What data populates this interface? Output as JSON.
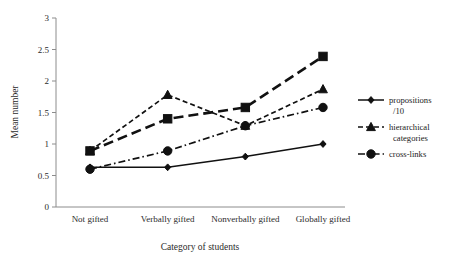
{
  "chart_data": {
    "type": "line",
    "title": "",
    "xlabel": "Category of students",
    "ylabel": "Mean number",
    "categories": [
      "Not gifted",
      "Verbally gifted",
      "Nonverbally gifted",
      "Globally gifted"
    ],
    "ylim": [
      0,
      3
    ],
    "yticks": [
      "0",
      "0.5",
      "1",
      "1.5",
      "2",
      "2.5",
      "3"
    ],
    "ytick_values": [
      0,
      0.5,
      1,
      1.5,
      2,
      2.5,
      3
    ],
    "grid": false,
    "legend_position": "right",
    "series": [
      {
        "name": "propositions /10",
        "legend_line1": "propositions",
        "legend_line2": "/10",
        "marker": "diamond",
        "line_style": "solid",
        "values": [
          0.63,
          0.63,
          0.8,
          1.0
        ]
      },
      {
        "name": "hierarchical categories",
        "legend_line1": "hierarchical",
        "legend_line2": "categories",
        "marker": "triangle",
        "line_style": "dashed",
        "values": [
          0.89,
          1.78,
          1.29,
          1.87
        ]
      },
      {
        "name": "cross-links",
        "legend_line1": "cross-links",
        "legend_line2": "",
        "marker": "circle",
        "line_style": "dash-dot",
        "values": [
          0.6,
          0.89,
          1.29,
          1.58
        ]
      },
      {
        "name": "unlabeled-square-series",
        "legend_line1": "",
        "legend_line2": "",
        "marker": "square",
        "line_style": "long-dash",
        "values": [
          0.89,
          1.4,
          1.58,
          2.39
        ]
      }
    ]
  },
  "axis": {
    "y_title": "Mean number",
    "x_title": "Category of students"
  },
  "legend": {
    "entries": [
      {
        "line1": "propositions",
        "line2": "/10",
        "marker": "diamond",
        "style": "solid"
      },
      {
        "line1": "hierarchical",
        "line2": "categories",
        "marker": "triangle",
        "style": "dashed"
      },
      {
        "line1": "cross-links",
        "line2": "",
        "marker": "circle",
        "style": "dash-dot"
      }
    ]
  },
  "colors": {
    "ink": "#111111",
    "axis": "#8c8c8c",
    "background": "#ffffff"
  }
}
